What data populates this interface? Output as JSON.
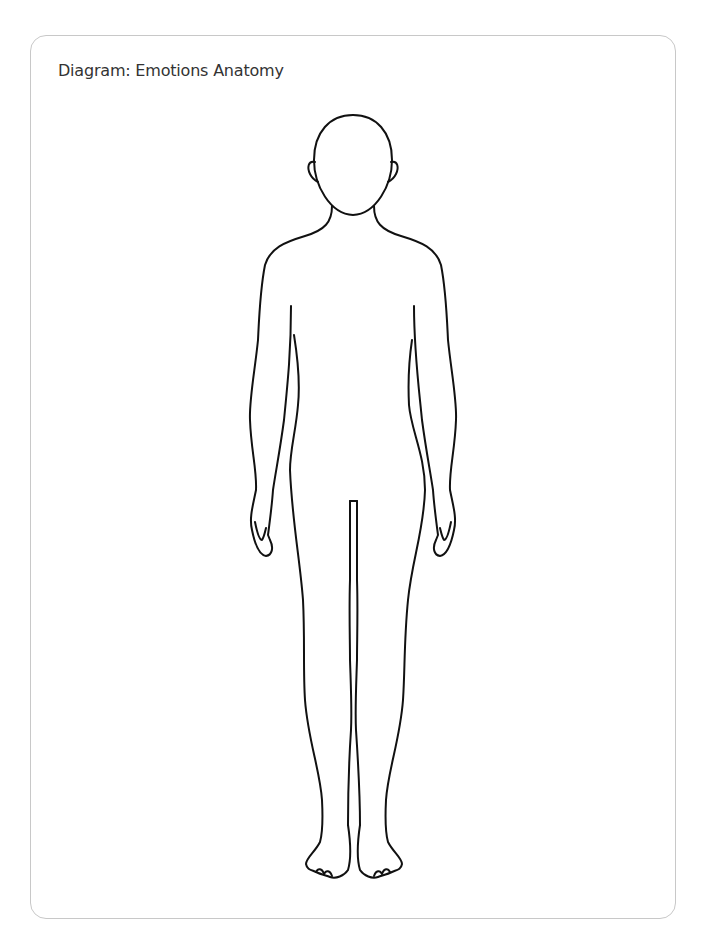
{
  "diagram": {
    "title": "Diagram: Emotions Anatomy",
    "figure": "human-body-outline-front-view",
    "stroke_color": "#111111",
    "card_border_color": "#c8c8c8"
  }
}
